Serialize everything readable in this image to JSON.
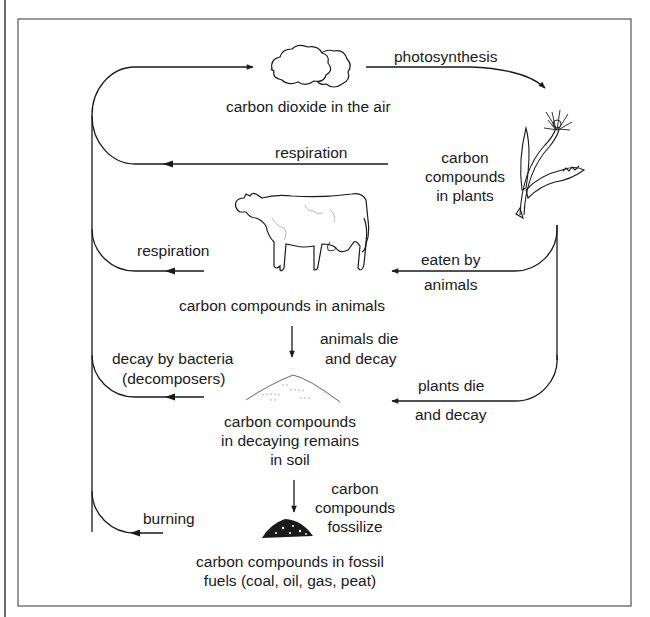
{
  "diagram": {
    "colors": {
      "ink": "#1a1a1a",
      "frame": "#555555",
      "background": "#ffffff"
    },
    "nodes": {
      "air": {
        "label": "carbon dioxide in the air",
        "icon": "cloud-icon"
      },
      "plants": {
        "line1": "carbon",
        "line2": "compounds",
        "line3": "in plants",
        "icon": "dandelion-plant-icon"
      },
      "animals": {
        "label": "carbon compounds in animals",
        "icon": "cow-icon"
      },
      "soil": {
        "line1": "carbon compounds",
        "line2": "in decaying remains",
        "line3": "in soil",
        "icon": "soil-heap-icon"
      },
      "fossil": {
        "line1": "carbon compounds in fossil",
        "line2": "fuels (coal, oil, gas, peat)",
        "icon": "coal-heap-icon"
      }
    },
    "processes": {
      "photosynthesis": "photosynthesis",
      "plant_respiration": "respiration",
      "animal_respiration": "respiration",
      "eaten_line1": "eaten by",
      "eaten_line2": "animals",
      "animals_die_line1": "animals die",
      "animals_die_line2": "and decay",
      "decay_line1": "decay by bacteria",
      "decay_line2": "(decomposers)",
      "plants_die_line1": "plants die",
      "plants_die_line2": "and decay",
      "fossilize_line1": "carbon",
      "fossilize_line2": "compounds",
      "fossilize_line3": "fossilize",
      "burning": "burning"
    }
  }
}
